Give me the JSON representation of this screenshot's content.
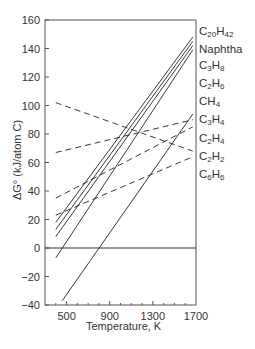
{
  "chart_data": {
    "type": "line",
    "title": "",
    "xlabel": "Temperature, K",
    "ylabel": "ΔG° (kJ/atom C)",
    "xlim": [
      300,
      1700
    ],
    "ylim": [
      -40,
      160
    ],
    "x_ticks": [
      500,
      900,
      1300,
      1700
    ],
    "y_ticks": [
      -40,
      -20,
      0,
      20,
      40,
      60,
      80,
      100,
      120,
      140,
      160
    ],
    "grid": false,
    "zero_line": true,
    "legend_position": "right",
    "legend": [
      "C20H42",
      "Naphtha",
      "C3H8",
      "C2H6",
      "CH4",
      "C3H4",
      "C2H4",
      "C2H2",
      "C6H6"
    ],
    "series": [
      {
        "name": "C20H42",
        "style": "solid",
        "x": [
          400,
          1670
        ],
        "y": [
          18,
          148
        ]
      },
      {
        "name": "Naphtha",
        "style": "solid",
        "x": [
          400,
          1670
        ],
        "y": [
          13,
          145
        ]
      },
      {
        "name": "C3H8",
        "style": "solid",
        "x": [
          400,
          1670
        ],
        "y": [
          8,
          142
        ]
      },
      {
        "name": "C2H6",
        "style": "solid",
        "x": [
          400,
          1670
        ],
        "y": [
          -7,
          139
        ]
      },
      {
        "name": "CH4",
        "style": "solid",
        "x": [
          460,
          1670
        ],
        "y": [
          -37,
          94
        ]
      },
      {
        "name": "C3H4",
        "style": "dashed",
        "x": [
          400,
          1670
        ],
        "y": [
          67,
          90
        ]
      },
      {
        "name": "C2H4",
        "style": "dashed",
        "x": [
          400,
          1670
        ],
        "y": [
          35,
          85
        ]
      },
      {
        "name": "C2H2",
        "style": "dashed",
        "x": [
          400,
          1670
        ],
        "y": [
          102,
          68
        ]
      },
      {
        "name": "C6H6",
        "style": "dashed",
        "x": [
          400,
          1670
        ],
        "y": [
          23,
          64
        ]
      }
    ]
  },
  "legend_items": [
    {
      "base": "C",
      "s1": "20",
      "mid": "H",
      "s2": "42"
    },
    {
      "base": "Naphtha",
      "s1": "",
      "mid": "",
      "s2": ""
    },
    {
      "base": "C",
      "s1": "3",
      "mid": "H",
      "s2": "8"
    },
    {
      "base": "C",
      "s1": "2",
      "mid": "H",
      "s2": "6"
    },
    {
      "base": "CH",
      "s1": "4",
      "mid": "",
      "s2": ""
    },
    {
      "base": "C",
      "s1": "3",
      "mid": "H",
      "s2": "4"
    },
    {
      "base": "C",
      "s1": "2",
      "mid": "H",
      "s2": "4"
    },
    {
      "base": "C",
      "s1": "2",
      "mid": "H",
      "s2": "2"
    },
    {
      "base": "C",
      "s1": "6",
      "mid": "H",
      "s2": "6"
    }
  ],
  "axis": {
    "xlabel": "Temperature, K",
    "ylabel": "ΔG° (kJ/atom C)"
  }
}
